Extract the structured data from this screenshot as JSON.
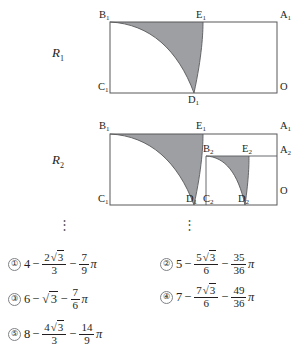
{
  "figures": [
    {
      "name": "R1",
      "label": "R",
      "label_sub": "1",
      "points": [
        {
          "id": "B1",
          "text": "B",
          "sub": "1"
        },
        {
          "id": "E1",
          "text": "E",
          "sub": "1"
        },
        {
          "id": "A1",
          "text": "A",
          "sub": "1"
        },
        {
          "id": "C1",
          "text": "C",
          "sub": "1"
        },
        {
          "id": "D1",
          "text": "D",
          "sub": "1"
        },
        {
          "id": "O",
          "text": "O",
          "sub": ""
        }
      ]
    },
    {
      "name": "R2",
      "label": "R",
      "label_sub": "2",
      "points": [
        {
          "id": "B1",
          "text": "B",
          "sub": "1"
        },
        {
          "id": "E1",
          "text": "E",
          "sub": "1"
        },
        {
          "id": "A1",
          "text": "A",
          "sub": "1"
        },
        {
          "id": "B2",
          "text": "B",
          "sub": "2"
        },
        {
          "id": "E2",
          "text": "E",
          "sub": "2"
        },
        {
          "id": "A2",
          "text": "A",
          "sub": "2"
        },
        {
          "id": "C1",
          "text": "C",
          "sub": "1"
        },
        {
          "id": "D1",
          "text": "D",
          "sub": "1"
        },
        {
          "id": "C2",
          "text": "C",
          "sub": "2"
        },
        {
          "id": "D2",
          "text": "D",
          "sub": "2"
        },
        {
          "id": "O",
          "text": "O",
          "sub": ""
        }
      ]
    }
  ],
  "ellipsis": {
    "glyph": "⋮",
    "left": "⋮",
    "right": "⋮"
  },
  "choices": [
    {
      "marker": "①",
      "integer": "4",
      "op1": "−",
      "term1": {
        "num_coef": "2",
        "num_radicand": "3",
        "den": "3"
      },
      "op2": "−",
      "term2": {
        "num": "7",
        "den": "9",
        "symbol": "π"
      }
    },
    {
      "marker": "②",
      "integer": "5",
      "op1": "−",
      "term1": {
        "num_coef": "5",
        "num_radicand": "3",
        "den": "6"
      },
      "op2": "−",
      "term2": {
        "num": "35",
        "den": "36",
        "symbol": "π"
      }
    },
    {
      "marker": "③",
      "integer": "6",
      "op1": "−",
      "term1": {
        "num_coef": "",
        "num_radicand": "3",
        "den": ""
      },
      "op2": "−",
      "term2": {
        "num": "7",
        "den": "6",
        "symbol": "π"
      }
    },
    {
      "marker": "④",
      "integer": "7",
      "op1": "−",
      "term1": {
        "num_coef": "7",
        "num_radicand": "3",
        "den": "6"
      },
      "op2": "−",
      "term2": {
        "num": "49",
        "den": "36",
        "symbol": "π"
      }
    },
    {
      "marker": "⑤",
      "integer": "8",
      "op1": "−",
      "term1": {
        "num_coef": "4",
        "num_radicand": "3",
        "den": "3"
      },
      "op2": "−",
      "term2": {
        "num": "14",
        "den": "9",
        "symbol": "π"
      }
    }
  ],
  "colors": {
    "stroke": "#58595b",
    "shade_fill": "#9d9fa2",
    "text": "#231f20",
    "marker_border": "#808285"
  }
}
